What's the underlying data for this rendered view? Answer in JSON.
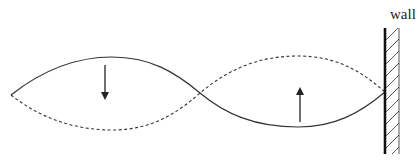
{
  "diagram": {
    "wall": {
      "label": "wall"
    },
    "waves": [
      {
        "name": "solid-wave",
        "style": "solid",
        "description": "wave displacement at one instant"
      },
      {
        "name": "dashed-wave",
        "style": "dashed",
        "description": "wave displacement half a period later"
      }
    ],
    "arrows": [
      {
        "name": "down-arrow",
        "direction": "down"
      },
      {
        "name": "up-arrow",
        "direction": "up"
      }
    ],
    "colors": {
      "line": "#333333",
      "wall": "#111111",
      "background": "#ffffff"
    }
  }
}
